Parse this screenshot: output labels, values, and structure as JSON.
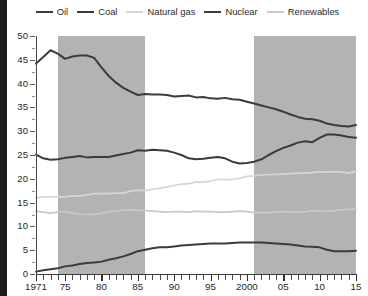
{
  "legend": {
    "position": "top-center",
    "items": [
      {
        "label": "Oil",
        "color": "#3b3b3b",
        "width": 2.3
      },
      {
        "label": "Coal",
        "color": "#3b3b3b",
        "width": 2.3
      },
      {
        "label": "Natural gas",
        "color": "#d6d6d6",
        "width": 2.0
      },
      {
        "label": "Nuclear",
        "color": "#3b3b3b",
        "width": 2.3
      },
      {
        "label": "Renewables",
        "color": "#c9c9c9",
        "width": 2.0
      }
    ]
  },
  "axes": {
    "y_ticks": [
      0,
      5,
      10,
      15,
      20,
      25,
      30,
      35,
      40,
      45,
      50
    ],
    "x_ticks": [
      {
        "value": 1971,
        "label": "1971"
      },
      {
        "value": 1975,
        "label": "75"
      },
      {
        "value": 1980,
        "label": "80"
      },
      {
        "value": 1985,
        "label": "85"
      },
      {
        "value": 1990,
        "label": "90"
      },
      {
        "value": 1995,
        "label": "95"
      },
      {
        "value": 2000,
        "label": "2000"
      },
      {
        "value": 2005,
        "label": "05"
      },
      {
        "value": 2010,
        "label": "10"
      },
      {
        "value": 2015,
        "label": "15"
      }
    ]
  },
  "bands": [
    {
      "start": 1974,
      "end": 1986,
      "color": "#b3b3b3"
    },
    {
      "start": 2001,
      "end": 2015,
      "color": "#b3b3b3"
    }
  ],
  "chart_data": {
    "type": "line",
    "title": "",
    "xlabel": "",
    "ylabel": "",
    "xlim": [
      1971,
      2015
    ],
    "ylim": [
      0,
      50
    ],
    "grid": false,
    "legend_position": "top-center",
    "shaded_bands": [
      [
        1974,
        1986
      ],
      [
        2001,
        2015
      ]
    ],
    "x": [
      1971,
      1972,
      1973,
      1974,
      1975,
      1976,
      1977,
      1978,
      1979,
      1980,
      1981,
      1982,
      1983,
      1984,
      1985,
      1986,
      1987,
      1988,
      1989,
      1990,
      1991,
      1992,
      1993,
      1994,
      1995,
      1996,
      1997,
      1998,
      1999,
      2000,
      2001,
      2002,
      2003,
      2004,
      2005,
      2006,
      2007,
      2008,
      2009,
      2010,
      2011,
      2012,
      2013,
      2014,
      2015
    ],
    "series": [
      {
        "name": "Oil",
        "color": "#3b3b3b",
        "values": [
          44.2,
          45.6,
          47.0,
          46.3,
          45.2,
          45.7,
          45.9,
          45.9,
          45.4,
          43.4,
          41.6,
          40.2,
          39.1,
          38.3,
          37.6,
          37.8,
          37.7,
          37.7,
          37.6,
          37.3,
          37.4,
          37.5,
          37.1,
          37.2,
          36.9,
          36.8,
          37.0,
          36.7,
          36.6,
          36.2,
          35.8,
          35.4,
          35.0,
          34.6,
          34.1,
          33.5,
          33.0,
          32.6,
          32.5,
          32.2,
          31.6,
          31.3,
          31.1,
          31.0,
          31.3
        ]
      },
      {
        "name": "Coal",
        "color": "#3b3b3b",
        "values": [
          25.1,
          24.3,
          24.0,
          24.1,
          24.4,
          24.6,
          24.8,
          24.5,
          24.6,
          24.6,
          24.6,
          24.9,
          25.2,
          25.5,
          26.0,
          25.9,
          26.1,
          26.0,
          25.9,
          25.5,
          25.0,
          24.3,
          24.1,
          24.2,
          24.4,
          24.6,
          24.3,
          23.6,
          23.2,
          23.3,
          23.6,
          24.1,
          25.0,
          25.8,
          26.5,
          27.0,
          27.6,
          27.9,
          27.7,
          28.6,
          29.3,
          29.3,
          29.1,
          28.8,
          28.6
        ]
      },
      {
        "name": "Natural gas",
        "color": "#d6d6d6",
        "values": [
          16.0,
          16.2,
          16.2,
          16.2,
          16.2,
          16.4,
          16.4,
          16.6,
          16.9,
          16.9,
          16.9,
          17.0,
          17.0,
          17.4,
          17.6,
          17.5,
          17.8,
          18.0,
          18.3,
          18.6,
          18.9,
          19.0,
          19.3,
          19.3,
          19.5,
          19.9,
          19.8,
          19.9,
          20.1,
          20.5,
          20.6,
          20.8,
          20.9,
          20.9,
          21.0,
          21.1,
          21.2,
          21.2,
          21.3,
          21.5,
          21.4,
          21.5,
          21.4,
          21.2,
          21.6
        ]
      },
      {
        "name": "Nuclear",
        "color": "#3b3b3b",
        "values": [
          0.5,
          0.8,
          1.0,
          1.2,
          1.6,
          1.8,
          2.1,
          2.3,
          2.4,
          2.6,
          3.0,
          3.3,
          3.7,
          4.2,
          4.8,
          5.1,
          5.4,
          5.6,
          5.6,
          5.8,
          6.0,
          6.1,
          6.2,
          6.3,
          6.4,
          6.4,
          6.4,
          6.5,
          6.6,
          6.6,
          6.6,
          6.6,
          6.5,
          6.4,
          6.3,
          6.2,
          6.0,
          5.8,
          5.7,
          5.6,
          5.1,
          4.8,
          4.8,
          4.8,
          4.9
        ]
      },
      {
        "name": "Renewables",
        "color": "#c9c9c9",
        "values": [
          13.2,
          13.0,
          12.8,
          13.0,
          13.1,
          12.8,
          12.6,
          12.5,
          12.5,
          12.8,
          13.1,
          13.2,
          13.4,
          13.5,
          13.4,
          13.3,
          13.2,
          13.1,
          13.0,
          13.1,
          13.1,
          13.0,
          13.2,
          13.1,
          13.1,
          13.0,
          13.0,
          13.1,
          13.2,
          13.1,
          12.9,
          12.9,
          12.9,
          13.0,
          13.1,
          13.0,
          13.0,
          13.1,
          13.3,
          13.2,
          13.2,
          13.3,
          13.5,
          13.6,
          13.7
        ]
      }
    ]
  }
}
